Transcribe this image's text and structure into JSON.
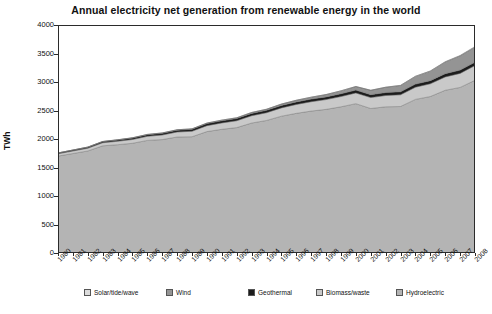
{
  "chart_data": {
    "type": "area",
    "title": "Annual electricity net generation from renewable energy in the world",
    "xlabel": "",
    "ylabel": "TWh",
    "ylim": [
      0,
      4000
    ],
    "yticks": [
      0,
      500,
      1000,
      1500,
      2000,
      2500,
      3000,
      3500,
      4000
    ],
    "grid": false,
    "legend_position": "bottom",
    "stacked": true,
    "categories": [
      "1980",
      "1981",
      "1982",
      "1983",
      "1984",
      "1985",
      "1986",
      "1987",
      "1988",
      "1989",
      "1990",
      "1991",
      "1992",
      "1993",
      "1994",
      "1995",
      "1996",
      "1997",
      "1998",
      "1999",
      "2000",
      "2001",
      "2002",
      "2003",
      "2004",
      "2005",
      "2006",
      "2007",
      "2008"
    ],
    "series": [
      {
        "name": "Hydroelectric",
        "color": "#b4b4b4",
        "values": [
          1700,
          1745,
          1790,
          1880,
          1900,
          1925,
          1975,
          1990,
          2035,
          2040,
          2130,
          2170,
          2200,
          2280,
          2325,
          2400,
          2450,
          2490,
          2520,
          2565,
          2620,
          2535,
          2565,
          2570,
          2695,
          2745,
          2855,
          2905,
          3030
        ]
      },
      {
        "name": "Biomass/waste",
        "color": "#c9c9c9",
        "values": [
          40,
          44,
          48,
          54,
          60,
          66,
          72,
          80,
          88,
          96,
          104,
          112,
          120,
          128,
          136,
          146,
          156,
          164,
          172,
          180,
          188,
          192,
          198,
          206,
          214,
          224,
          234,
          246,
          258
        ]
      },
      {
        "name": "Geothermal",
        "color": "#1c1c1c",
        "values": [
          14,
          16,
          18,
          20,
          23,
          26,
          28,
          30,
          32,
          34,
          36,
          38,
          39,
          41,
          42,
          43,
          45,
          46,
          47,
          49,
          50,
          51,
          52,
          53,
          54,
          55,
          57,
          58,
          60
        ]
      },
      {
        "name": "Wind",
        "color": "#949494",
        "values": [
          1,
          1,
          2,
          2,
          3,
          4,
          5,
          6,
          7,
          8,
          9,
          11,
          13,
          16,
          19,
          23,
          28,
          33,
          40,
          50,
          62,
          76,
          92,
          110,
          135,
          166,
          205,
          250,
          265
        ]
      },
      {
        "name": "Solar/tide/wave",
        "color": "#dcdcdc",
        "values": [
          1,
          1,
          1,
          1,
          1,
          1,
          1,
          1,
          1,
          1,
          1,
          1,
          1,
          1,
          1,
          2,
          2,
          2,
          2,
          2,
          2,
          2,
          3,
          3,
          4,
          5,
          6,
          8,
          10
        ]
      }
    ],
    "totals": [
      1756,
      1807,
      1859,
      1957,
      1987,
      2022,
      2081,
      2107,
      2163,
      2179,
      2280,
      2332,
      2373,
      2466,
      2523,
      2614,
      2681,
      2735,
      2781,
      2846,
      2922,
      2856,
      2910,
      2942,
      3102,
      3195,
      3357,
      3467,
      3623
    ]
  },
  "legend": {
    "items": [
      {
        "label": "Solar/tide/wave",
        "color": "#dcdcdc",
        "left": 26
      },
      {
        "label": "Wind",
        "color": "#949494",
        "left": 108
      },
      {
        "label": "Geothermal",
        "color": "#1c1c1c",
        "left": 190
      },
      {
        "label": "Biomass/waste",
        "color": "#c9c9c9",
        "left": 258
      },
      {
        "label": "Hydroelectric",
        "color": "#b4b4b4",
        "left": 338
      }
    ]
  }
}
